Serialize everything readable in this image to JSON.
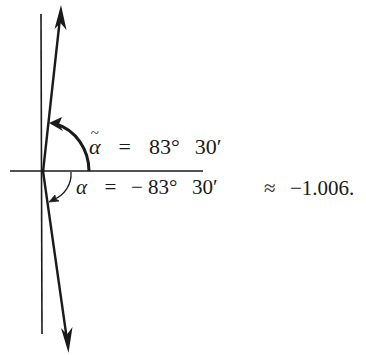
{
  "figure": {
    "type": "angle-diagram",
    "colors": {
      "ink": "#1a1a1a",
      "background": "#ffffff"
    },
    "axes": {
      "horizontal": {
        "x1": 10,
        "y1": 171,
        "x2": 203,
        "y2": 171
      },
      "vertical": {
        "x1": 41,
        "y1": 14,
        "x2": 42,
        "y2": 334
      }
    },
    "vectors": [
      {
        "name": "upper-ray",
        "from": [
          43,
          171
        ],
        "to": [
          61,
          8
        ],
        "arrow": "end"
      },
      {
        "name": "lower-ray",
        "from": [
          43,
          171
        ],
        "to": [
          68,
          352
        ],
        "arrow": "end"
      }
    ],
    "arcs": [
      {
        "name": "alpha-tilde-arc",
        "direction": "counterclockwise",
        "arrow": "end"
      },
      {
        "name": "alpha-arc",
        "direction": "clockwise",
        "arrow": "end"
      }
    ]
  },
  "labels": {
    "upper": {
      "symbol": "α",
      "accent": "~",
      "equals": "=",
      "degrees": "83°",
      "minutes": "30′"
    },
    "lower": {
      "symbol": "α",
      "equals": "=",
      "sign": "−",
      "degrees": "83°",
      "minutes": "30′"
    },
    "approx": {
      "relation": "≈",
      "value": "−1.006."
    }
  }
}
